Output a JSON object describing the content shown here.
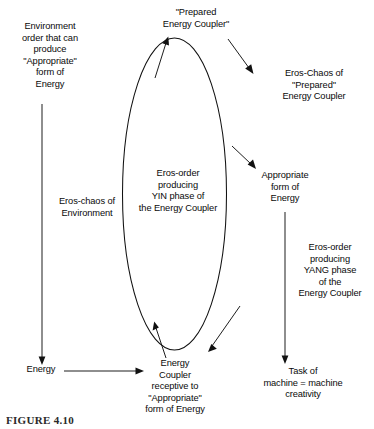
{
  "diagram": {
    "type": "cycle-diagram",
    "title_visible": false,
    "caption": "FIGURE 4.10",
    "nodes": {
      "environment_order": "Environment\norder that can\nproduce\n\"Appropriate\"\nform of\nEnergy",
      "eros_chaos_environment": "Eros-chaos of\nEnvironment",
      "energy": "Energy",
      "prepared_energy_coupler": "\"Prepared\nEnergy Coupler\"",
      "eros_order_yin": "Eros-order\nproducing\nYIN phase of\nthe Energy Coupler",
      "energy_coupler_receptive": "Energy\nCoupler\nreceptive to\n\"Appropriate\"\nform of Energy",
      "eros_chaos_prepared": "Eros-Chaos of\n\"Prepared\"\nEnergy Coupler",
      "appropriate_form_of_energy": "Appropriate\nform of\nEnergy",
      "eros_order_yang": "Eros-order\nproducing\nYANG phase\nof the\nEnergy Coupler",
      "task_of_machine": "Task of\nmachine = machine\ncreativity"
    },
    "edges": [
      {
        "name": "environment-to-energy",
        "from": "environment_order",
        "to": "energy",
        "style": "straight-vertical",
        "label": "eros_chaos_environment"
      },
      {
        "name": "energy-to-energy-coupler",
        "from": "energy",
        "to": "energy_coupler_receptive",
        "style": "straight-horizontal"
      },
      {
        "name": "coupler-to-prepared",
        "from": "energy_coupler_receptive",
        "to": "prepared_energy_coupler",
        "style": "curve-up-left",
        "label": "eros_order_yin"
      },
      {
        "name": "prepared-to-eros-chaos",
        "from": "prepared_energy_coupler",
        "to": "eros_chaos_prepared",
        "style": "diagonal-down-right"
      },
      {
        "name": "ellipse-to-appropriate-form",
        "from": "eros_order_yin",
        "to": "appropriate_form_of_energy",
        "style": "diagonal-down-right"
      },
      {
        "name": "appropriate-form-to-task",
        "from": "appropriate_form_of_energy",
        "to": "task_of_machine",
        "style": "straight-vertical",
        "label": "eros_order_yang"
      },
      {
        "name": "return-to-coupler",
        "from": "eros_chaos_prepared",
        "to": "energy_coupler_receptive",
        "style": "diagonal-down-left"
      }
    ],
    "colors": {
      "stroke": "#111111",
      "text": "#0a0a0a",
      "background": "#ffffff"
    }
  }
}
